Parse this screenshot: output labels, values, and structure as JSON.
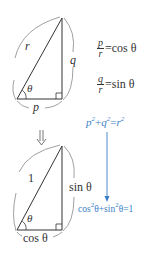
{
  "top_triangle": {
    "hypotenuse_label": "r",
    "opposite_label": "q",
    "adjacent_label": "p",
    "angle_label": "θ"
  },
  "relations": {
    "cos": {
      "numerator": "p",
      "denominator": "r",
      "rhs": "=cos θ"
    },
    "sin": {
      "numerator": "q",
      "denominator": "r",
      "rhs": "=sin θ"
    }
  },
  "transition_arrow": "⇓",
  "bottom_triangle": {
    "hypotenuse_label": "1",
    "opposite_label": "sin θ",
    "adjacent_label": "cos θ",
    "angle_label": "θ"
  },
  "pythagoras": {
    "general": {
      "a": "p",
      "b": "q",
      "c": "r",
      "plus": "+",
      "eq": "="
    },
    "identity": {
      "t1": "cos",
      "t1b": "θ+sin",
      "t2b": "θ=1"
    }
  },
  "colors": {
    "ink": "#333333",
    "accent": "#3a7fc8",
    "arc": "#777777"
  }
}
